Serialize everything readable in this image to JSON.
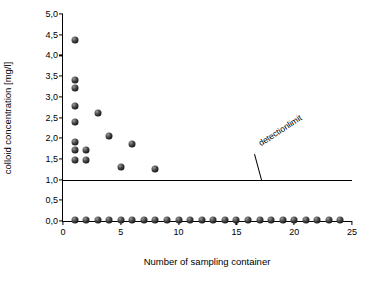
{
  "chart_data": {
    "type": "scatter",
    "title": "",
    "xlabel": "Number of sampling container",
    "ylabel": "colloid concentration [mg/l]",
    "xlim": [
      0,
      25
    ],
    "ylim": [
      0.0,
      5.0
    ],
    "xticks": [
      "0",
      "5",
      "10",
      "15",
      "20",
      "25"
    ],
    "xtick_values": [
      0,
      5,
      10,
      15,
      20,
      25
    ],
    "yticks": [
      "0,0",
      "0,5",
      "1,0",
      "1,5",
      "2,0",
      "2,5",
      "3,0",
      "3,5",
      "4,0",
      "4,5",
      "5,0"
    ],
    "ytick_values": [
      0.0,
      0.5,
      1.0,
      1.5,
      2.0,
      2.5,
      3.0,
      3.5,
      4.0,
      4.5,
      5.0
    ],
    "grid": false,
    "legend": null,
    "annotations": [
      {
        "text": "detectionlimit",
        "x": 17.2,
        "y": 2.0,
        "rotation": -33
      }
    ],
    "reference_line": {
      "label": "detection limit",
      "y": 1.0,
      "x_start": 0,
      "x_end": 25
    },
    "series": [
      {
        "name": "colloid concentration",
        "marker": "sphere",
        "color": "#111111",
        "points": [
          {
            "x": 1.0,
            "y": 4.38
          },
          {
            "x": 1.0,
            "y": 3.4
          },
          {
            "x": 1.0,
            "y": 3.22
          },
          {
            "x": 1.0,
            "y": 2.78
          },
          {
            "x": 1.0,
            "y": 2.38
          },
          {
            "x": 3.0,
            "y": 2.62
          },
          {
            "x": 1.0,
            "y": 1.9
          },
          {
            "x": 1.0,
            "y": 1.72
          },
          {
            "x": 2.0,
            "y": 1.72
          },
          {
            "x": 4.0,
            "y": 2.05
          },
          {
            "x": 6.0,
            "y": 1.86
          },
          {
            "x": 1.0,
            "y": 1.48
          },
          {
            "x": 2.0,
            "y": 1.48
          },
          {
            "x": 5.0,
            "y": 1.3
          },
          {
            "x": 8.0,
            "y": 1.26
          },
          {
            "x": 1.0,
            "y": 0.03
          },
          {
            "x": 2.0,
            "y": 0.03
          },
          {
            "x": 3.0,
            "y": 0.03
          },
          {
            "x": 4.0,
            "y": 0.03
          },
          {
            "x": 5.0,
            "y": 0.03
          },
          {
            "x": 6.0,
            "y": 0.03
          },
          {
            "x": 7.0,
            "y": 0.03
          },
          {
            "x": 8.0,
            "y": 0.03
          },
          {
            "x": 9.0,
            "y": 0.03
          },
          {
            "x": 10.0,
            "y": 0.03
          },
          {
            "x": 11.0,
            "y": 0.03
          },
          {
            "x": 12.0,
            "y": 0.03
          },
          {
            "x": 13.0,
            "y": 0.03
          },
          {
            "x": 14.0,
            "y": 0.03
          },
          {
            "x": 15.0,
            "y": 0.03
          },
          {
            "x": 16.0,
            "y": 0.03
          },
          {
            "x": 17.0,
            "y": 0.03
          },
          {
            "x": 18.0,
            "y": 0.03
          },
          {
            "x": 19.0,
            "y": 0.03
          },
          {
            "x": 20.0,
            "y": 0.03
          },
          {
            "x": 21.0,
            "y": 0.03
          },
          {
            "x": 22.0,
            "y": 0.03
          },
          {
            "x": 23.0,
            "y": 0.03
          },
          {
            "x": 24.0,
            "y": 0.03
          }
        ]
      }
    ]
  }
}
